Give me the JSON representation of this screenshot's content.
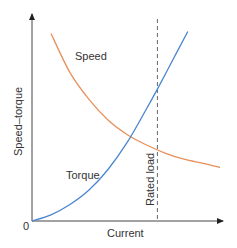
{
  "chart_data": {
    "type": "line",
    "title": "",
    "xlabel": "Current",
    "ylabel": "Speed–torque",
    "origin_label": "0",
    "grid": false,
    "legend": "inline labels",
    "x_range": [
      0,
      1
    ],
    "y_range": [
      0,
      1
    ],
    "series": [
      {
        "name": "Speed",
        "color": "#e8905a",
        "points": [
          [
            0.1,
            0.91
          ],
          [
            0.2,
            0.72
          ],
          [
            0.3,
            0.59
          ],
          [
            0.4,
            0.49
          ],
          [
            0.5,
            0.42
          ],
          [
            0.6,
            0.37
          ],
          [
            0.7,
            0.33
          ],
          [
            0.8,
            0.3
          ],
          [
            0.9,
            0.28
          ],
          [
            0.99,
            0.26
          ]
        ]
      },
      {
        "name": "Torque",
        "color": "#4a86cf",
        "points": [
          [
            0.0,
            0.0
          ],
          [
            0.1,
            0.03
          ],
          [
            0.2,
            0.08
          ],
          [
            0.3,
            0.15
          ],
          [
            0.4,
            0.25
          ],
          [
            0.5,
            0.38
          ],
          [
            0.6,
            0.54
          ],
          [
            0.66,
            0.64
          ],
          [
            0.74,
            0.78
          ],
          [
            0.82,
            0.92
          ]
        ]
      }
    ],
    "annotations": [
      {
        "type": "vertical-dashed-line",
        "x": 0.66,
        "label": "Rated load",
        "color": "#666666"
      }
    ]
  }
}
